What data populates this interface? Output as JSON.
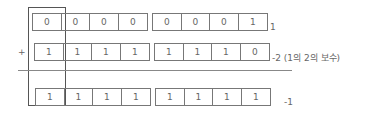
{
  "diagram": {
    "operator": "+",
    "rows": [
      {
        "name": "operand-1",
        "groups": [
          [
            "0",
            "0",
            "0",
            "0"
          ],
          [
            "0",
            "0",
            "0",
            "1"
          ]
        ],
        "label": "1"
      },
      {
        "name": "operand-2",
        "groups": [
          [
            "1",
            "1",
            "1",
            "1"
          ],
          [
            "1",
            "1",
            "1",
            "0"
          ]
        ],
        "label": "-2 (1의 2의 보수)"
      },
      {
        "name": "result",
        "groups": [
          [
            "1",
            "1",
            "1",
            "1"
          ],
          [
            "1",
            "1",
            "1",
            "1"
          ]
        ],
        "label": "-1"
      }
    ],
    "highlight": "sign-bit column"
  }
}
